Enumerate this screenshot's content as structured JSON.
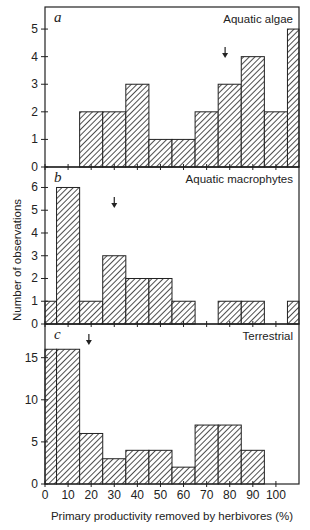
{
  "chart_data": {
    "type": "bar",
    "xlabel": "Primary productivity removed by herbivores (%)",
    "ylabel": "Number of observations",
    "x_ticks": [
      0,
      10,
      20,
      30,
      40,
      50,
      60,
      70,
      80,
      90,
      100
    ],
    "xlim": [
      0,
      110
    ],
    "bin_edges": [
      0,
      5,
      15,
      25,
      35,
      45,
      55,
      65,
      75,
      85,
      95,
      105,
      110
    ],
    "panels": [
      {
        "letter": "a",
        "title": "Aquatic algae",
        "ylim": [
          0,
          5.8
        ],
        "y_ticks": [
          0,
          1,
          2,
          3,
          4,
          5
        ],
        "values": [
          0,
          0,
          2,
          2,
          3,
          1,
          1,
          2,
          3,
          4,
          2,
          5
        ],
        "arrow_x": 78
      },
      {
        "letter": "b",
        "title": "Aquatic macrophytes",
        "ylim": [
          0,
          6.9
        ],
        "y_ticks": [
          0,
          1,
          2,
          3,
          4,
          5,
          6
        ],
        "values": [
          1,
          6,
          1,
          3,
          2,
          2,
          1,
          0,
          1,
          1,
          0,
          1
        ],
        "arrow_x": 30
      },
      {
        "letter": "c",
        "title": "Terrestrial",
        "ylim": [
          0,
          19
        ],
        "y_ticks": [
          0,
          5,
          10,
          15
        ],
        "values": [
          16,
          16,
          6,
          3,
          4,
          4,
          2,
          7,
          7,
          4,
          0,
          0
        ],
        "arrow_x": 19
      }
    ]
  }
}
